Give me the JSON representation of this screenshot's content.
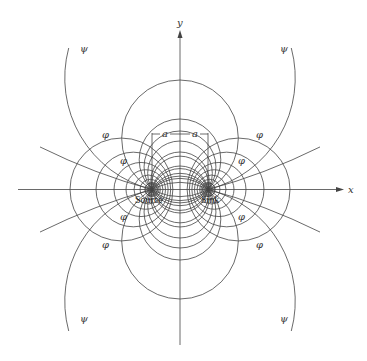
{
  "diagram": {
    "axes": {
      "x_label": "x",
      "y_label": "y"
    },
    "labels": {
      "source": "Source",
      "sink": "Sink",
      "a": "a",
      "psi": "ψ",
      "phi": "φ"
    },
    "geometry": {
      "origin": [
        180,
        189.5
      ],
      "a": 28,
      "streamline_top_y": [
        80,
        119,
        131,
        141,
        152,
        166
      ],
      "potential_circle_lefts": [
        70,
        96,
        114,
        126,
        134,
        140,
        145
      ],
      "outer_psi_circle": {
        "center_offset": 112.5,
        "r": 115
      }
    },
    "psi_label_positions": [
      [
        80,
        52
      ],
      [
        280,
        52
      ],
      [
        80,
        322
      ],
      [
        280,
        322
      ]
    ],
    "phi_label_positions": [
      [
        102,
        138
      ],
      [
        256,
        138
      ],
      [
        120,
        164
      ],
      [
        238,
        164
      ],
      [
        120,
        220
      ],
      [
        238,
        220
      ],
      [
        102,
        248
      ],
      [
        256,
        248
      ]
    ],
    "colors": {
      "line": "#444444",
      "text": "#222222",
      "background": "#ffffff"
    }
  }
}
